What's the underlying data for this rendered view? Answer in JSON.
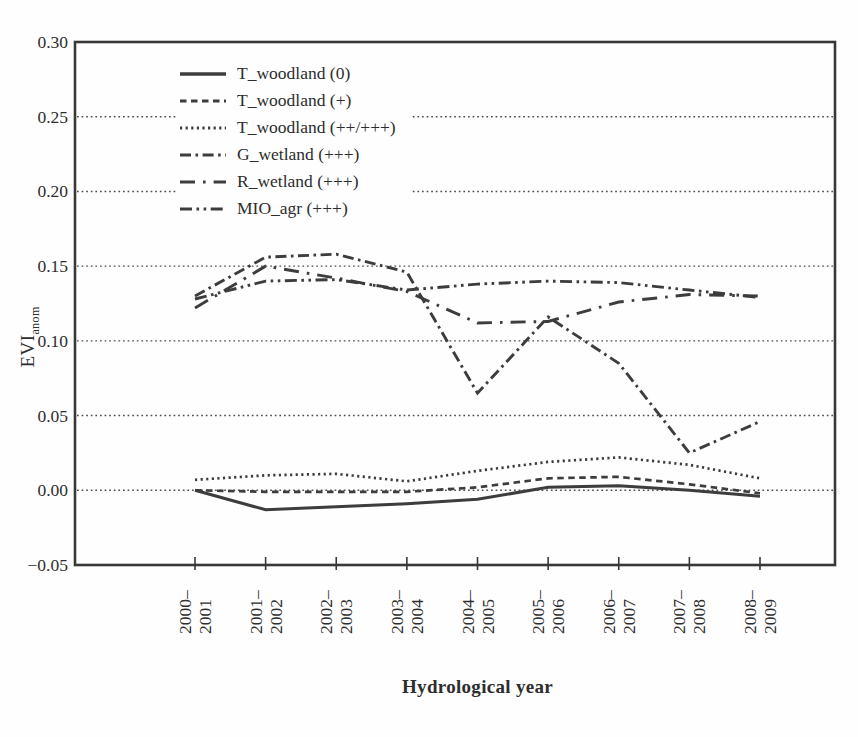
{
  "figure": {
    "y_axis_title": {
      "main": "EVI",
      "sub": "anom"
    },
    "x_axis_title": "Hydrological year"
  },
  "chart_data": {
    "type": "line",
    "title": "",
    "xlabel": "Hydrological year",
    "ylabel": "EVI_anom",
    "categories": [
      "2000–2001",
      "2001–2002",
      "2002–2003",
      "2003–2004",
      "2004–2005",
      "2005–2006",
      "2006–2007",
      "2007–2008",
      "2008–2009"
    ],
    "series": [
      {
        "name": "T_woodland (0)",
        "line_style": "solid",
        "values": [
          0.0,
          -0.013,
          -0.011,
          -0.009,
          -0.006,
          0.002,
          0.003,
          0.0,
          -0.004
        ]
      },
      {
        "name": "T_woodland (+)",
        "line_style": "dashed",
        "values": [
          0.0,
          -0.001,
          -0.001,
          -0.001,
          0.002,
          0.008,
          0.009,
          0.004,
          -0.002
        ]
      },
      {
        "name": "T_woodland (++/+++)",
        "line_style": "dotted",
        "values": [
          0.007,
          0.01,
          0.011,
          0.006,
          0.013,
          0.019,
          0.022,
          0.017,
          0.008
        ]
      },
      {
        "name": "G_wetland (+++)",
        "line_style": "dashdot",
        "values": [
          0.13,
          0.156,
          0.158,
          0.146,
          0.065,
          0.116,
          0.085,
          0.025,
          0.046
        ]
      },
      {
        "name": "R_wetland (+++)",
        "line_style": "longdashdot",
        "values": [
          0.122,
          0.15,
          0.142,
          0.133,
          0.112,
          0.113,
          0.126,
          0.131,
          0.13
        ]
      },
      {
        "name": "MIO_agr (+++)",
        "line_style": "dashdotdot",
        "values": [
          0.128,
          0.14,
          0.141,
          0.134,
          0.138,
          0.14,
          0.139,
          0.134,
          0.129
        ]
      }
    ],
    "y_axis": {
      "min": -0.05,
      "max": 0.3,
      "tick_step": 0.05,
      "tick_labels": [
        "0.30",
        "0.25",
        "0.20",
        "0.15",
        "0.10",
        "0.05",
        "0.00",
        "−0.05"
      ],
      "gridline_values": [
        0.25,
        0.2,
        0.15,
        0.1,
        0.05,
        0.0
      ]
    },
    "legend_position": "top-left-inside",
    "grid": "horizontal-dotted",
    "line_color": "#3d3d3d",
    "frame_color": "#383838",
    "grid_color": "#4e4e4e"
  }
}
